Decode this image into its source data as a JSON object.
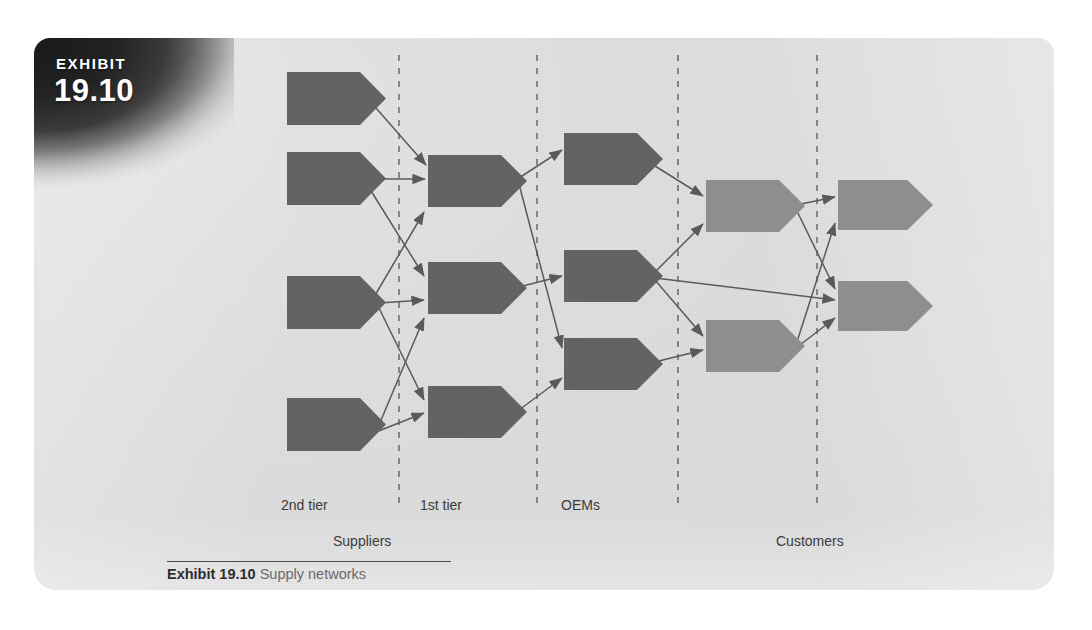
{
  "exhibit": {
    "tab_word": "EXHIBIT",
    "tab_number": "19.10"
  },
  "caption": {
    "label": "Exhibit 19.10",
    "title": "Supply networks"
  },
  "diagram": {
    "title": "Supply networks",
    "type": "network-flow",
    "colors": {
      "background": "#dcdcdc",
      "node_dark": "#636363",
      "node_light": "#8e8e8e",
      "arrow": "#5a5a5a",
      "divider": "#6f6f6f",
      "text": "#3b3b3b"
    },
    "tier_labels": [
      {
        "id": "tier-2nd",
        "text": "2nd tier",
        "x": 281,
        "y": 497
      },
      {
        "id": "tier-1st",
        "text": "1st tier",
        "x": 420,
        "y": 497
      },
      {
        "id": "tier-oems",
        "text": "OEMs",
        "x": 561,
        "y": 497
      }
    ],
    "group_labels": [
      {
        "id": "group-suppliers",
        "text": "Suppliers",
        "x": 333,
        "y": 533
      },
      {
        "id": "group-customers",
        "text": "Customers",
        "x": 776,
        "y": 533
      }
    ],
    "dividers": [
      {
        "id": "divider-1",
        "x": 399
      },
      {
        "id": "divider-2",
        "x": 537
      },
      {
        "id": "divider-3",
        "x": 678
      },
      {
        "id": "divider-4",
        "x": 817
      }
    ],
    "divider_span": {
      "y1": 55,
      "y2": 510
    },
    "node_shape": "pentagon-arrow",
    "columns": [
      {
        "id": "col-2nd-tier",
        "label": "2nd tier",
        "shade": "dark",
        "nodes": [
          {
            "id": "s2-1",
            "x": 287,
            "y": 72,
            "w": 99,
            "h": 53
          },
          {
            "id": "s2-2",
            "x": 287,
            "y": 152,
            "w": 99,
            "h": 53
          },
          {
            "id": "s2-3",
            "x": 287,
            "y": 276,
            "w": 99,
            "h": 53
          },
          {
            "id": "s2-4",
            "x": 287,
            "y": 398,
            "w": 99,
            "h": 53
          }
        ]
      },
      {
        "id": "col-1st-tier",
        "label": "1st tier",
        "shade": "dark",
        "nodes": [
          {
            "id": "s1-1",
            "x": 428,
            "y": 155,
            "w": 99,
            "h": 52
          },
          {
            "id": "s1-2",
            "x": 428,
            "y": 262,
            "w": 99,
            "h": 52
          },
          {
            "id": "s1-3",
            "x": 428,
            "y": 386,
            "w": 99,
            "h": 52
          }
        ]
      },
      {
        "id": "col-oems",
        "label": "OEMs",
        "shade": "dark",
        "nodes": [
          {
            "id": "oem-1",
            "x": 564,
            "y": 133,
            "w": 99,
            "h": 52
          },
          {
            "id": "oem-2",
            "x": 564,
            "y": 250,
            "w": 99,
            "h": 52
          },
          {
            "id": "oem-3",
            "x": 564,
            "y": 338,
            "w": 99,
            "h": 52
          }
        ]
      },
      {
        "id": "col-customers-1",
        "label": "",
        "shade": "light",
        "nodes": [
          {
            "id": "c1-1",
            "x": 706,
            "y": 180,
            "w": 99,
            "h": 52
          },
          {
            "id": "c1-2",
            "x": 706,
            "y": 320,
            "w": 99,
            "h": 52
          }
        ]
      },
      {
        "id": "col-customers-2",
        "label": "",
        "shade": "light",
        "nodes": [
          {
            "id": "c2-1",
            "x": 838,
            "y": 180,
            "w": 95,
            "h": 50
          },
          {
            "id": "c2-2",
            "x": 838,
            "y": 281,
            "w": 95,
            "h": 50
          }
        ]
      }
    ],
    "links": [
      {
        "id": "link-s2-1-s1-1",
        "from": "s2-1",
        "to": "s1-1",
        "x1": 376,
        "y1": 108,
        "x2": 426,
        "y2": 165
      },
      {
        "id": "link-s2-2-s1-1",
        "from": "s2-2",
        "to": "s1-1",
        "x1": 368,
        "y1": 179,
        "x2": 425,
        "y2": 179
      },
      {
        "id": "link-s2-2-s1-2",
        "from": "s2-2",
        "to": "s1-2",
        "x1": 368,
        "y1": 186,
        "x2": 424,
        "y2": 276
      },
      {
        "id": "link-s2-3-s1-1",
        "from": "s2-3",
        "to": "s1-1",
        "x1": 374,
        "y1": 297,
        "x2": 424,
        "y2": 212
      },
      {
        "id": "link-s2-3-s1-2",
        "from": "s2-3",
        "to": "s1-2",
        "x1": 379,
        "y1": 303,
        "x2": 424,
        "y2": 300
      },
      {
        "id": "link-s2-3-s1-3",
        "from": "s2-3",
        "to": "s1-3",
        "x1": 379,
        "y1": 308,
        "x2": 424,
        "y2": 400
      },
      {
        "id": "link-s2-4-s1-3",
        "from": "s2-4",
        "to": "s1-3",
        "x1": 376,
        "y1": 432,
        "x2": 424,
        "y2": 413
      },
      {
        "id": "link-s2-4-s1-2",
        "from": "s2-4",
        "to": "s1-2",
        "x1": 376,
        "y1": 432,
        "x2": 424,
        "y2": 318
      },
      {
        "id": "link-s1-1-oem-1",
        "from": "s1-1",
        "to": "oem-1",
        "x1": 519,
        "y1": 178,
        "x2": 562,
        "y2": 150
      },
      {
        "id": "link-s1-1-oem-3",
        "from": "s1-1",
        "to": "oem-3",
        "x1": 519,
        "y1": 184,
        "x2": 562,
        "y2": 348
      },
      {
        "id": "link-s1-2-oem-2",
        "from": "s1-2",
        "to": "oem-2",
        "x1": 519,
        "y1": 287,
        "x2": 562,
        "y2": 276
      },
      {
        "id": "link-s1-3-oem-3",
        "from": "s1-3",
        "to": "oem-3",
        "x1": 519,
        "y1": 410,
        "x2": 562,
        "y2": 378
      },
      {
        "id": "link-oem-1-c1-1",
        "from": "oem-1",
        "to": "c1-1",
        "x1": 655,
        "y1": 166,
        "x2": 703,
        "y2": 196
      },
      {
        "id": "link-oem-2-c1-1",
        "from": "oem-2",
        "to": "c1-1",
        "x1": 655,
        "y1": 272,
        "x2": 703,
        "y2": 224
      },
      {
        "id": "link-oem-2-c1-2",
        "from": "oem-2",
        "to": "c1-2",
        "x1": 655,
        "y1": 280,
        "x2": 703,
        "y2": 336
      },
      {
        "id": "link-oem-2-c2-2",
        "from": "oem-2",
        "to": "c2-2",
        "x1": 655,
        "y1": 278,
        "x2": 835,
        "y2": 300
      },
      {
        "id": "link-oem-3-c1-2",
        "from": "oem-3",
        "to": "c1-2",
        "x1": 655,
        "y1": 362,
        "x2": 703,
        "y2": 350
      },
      {
        "id": "link-c1-1-c2-1",
        "from": "c1-1",
        "to": "c2-1",
        "x1": 796,
        "y1": 205,
        "x2": 835,
        "y2": 197
      },
      {
        "id": "link-c1-1-c2-2",
        "from": "c1-1",
        "to": "c2-2",
        "x1": 796,
        "y1": 209,
        "x2": 835,
        "y2": 289
      },
      {
        "id": "link-c1-2-c2-1",
        "from": "c1-2",
        "to": "c2-1",
        "x1": 796,
        "y1": 345,
        "x2": 835,
        "y2": 223
      },
      {
        "id": "link-c1-2-c2-2",
        "from": "c1-2",
        "to": "c2-2",
        "x1": 796,
        "y1": 348,
        "x2": 835,
        "y2": 318
      }
    ]
  }
}
